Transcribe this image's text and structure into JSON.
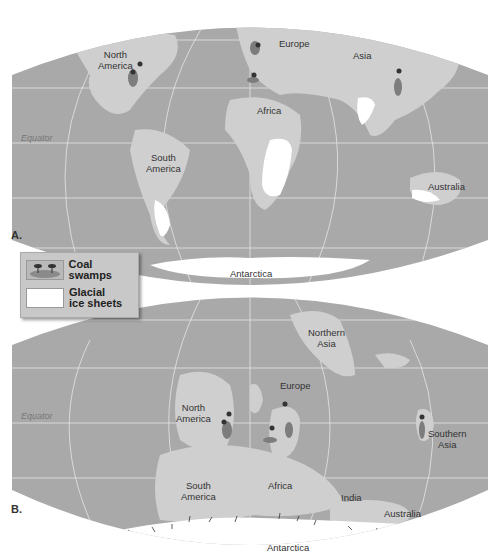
{
  "figure": {
    "panels": [
      {
        "id": "A",
        "label": "A.",
        "equator_label": "Equator",
        "regions": [
          {
            "name": "North America",
            "line1": "North",
            "line2": "America"
          },
          {
            "name": "Europe",
            "line1": "Europe"
          },
          {
            "name": "Asia",
            "line1": "Asia"
          },
          {
            "name": "Africa",
            "line1": "Africa"
          },
          {
            "name": "South America",
            "line1": "South",
            "line2": "America"
          },
          {
            "name": "Australia",
            "line1": "Australia"
          },
          {
            "name": "Antarctica",
            "line1": "Antarctica"
          }
        ]
      },
      {
        "id": "B",
        "label": "B.",
        "equator_label": "Equator",
        "regions": [
          {
            "name": "Northern Asia",
            "line1": "Northern",
            "line2": "Asia"
          },
          {
            "name": "Europe",
            "line1": "Europe"
          },
          {
            "name": "North America",
            "line1": "North",
            "line2": "America"
          },
          {
            "name": "Southern Asia",
            "line1": "Southern",
            "line2": "Asia"
          },
          {
            "name": "South America",
            "line1": "South",
            "line2": "America"
          },
          {
            "name": "Africa",
            "line1": "Africa"
          },
          {
            "name": "India",
            "line1": "India"
          },
          {
            "name": "Australia",
            "line1": "Australia"
          },
          {
            "name": "Antarctica",
            "line1": "Antarctica"
          }
        ]
      }
    ],
    "legend": {
      "items": [
        {
          "label": "Coal swamps",
          "symbol": "coal-swamp-icon"
        },
        {
          "label_line1": "Glacial",
          "label_line2": "ice sheets",
          "symbol": "ice-sheet-swatch"
        }
      ]
    },
    "colors": {
      "ocean": "#a9a9a9",
      "land": "#cfcfcf",
      "ice": "#ffffff",
      "coal": "#7d7d7d",
      "grid": "#e6e6e6"
    }
  }
}
